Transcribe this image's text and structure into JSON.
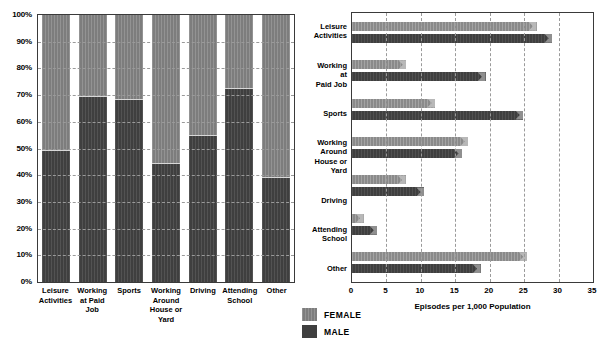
{
  "legend": {
    "items": [
      {
        "key": "female",
        "label": "FEMALE",
        "color": "#7d7d7d"
      },
      {
        "key": "male",
        "label": "MALE",
        "color": "#3f3f3f"
      }
    ]
  },
  "chart_data": [
    {
      "type": "bar",
      "id": "stacked-percent-share",
      "title": "",
      "stacked": true,
      "orientation": "vertical",
      "xlabel": "",
      "ylabel": "",
      "ylim": [
        0,
        100
      ],
      "ytick_labels": [
        "0%",
        "10%",
        "20%",
        "30%",
        "40%",
        "50%",
        "60%",
        "70%",
        "80%",
        "90%",
        "100%"
      ],
      "ytick_values": [
        0,
        10,
        20,
        30,
        40,
        50,
        60,
        70,
        80,
        90,
        100
      ],
      "grid": true,
      "categories": [
        "Leisure Activities",
        "Working at Paid Job",
        "Sports",
        "Working Around House or Yard",
        "Driving",
        "Attending School",
        "Other"
      ],
      "category_lines": [
        [
          "Leisure",
          "Activities"
        ],
        [
          "Working",
          "at Paid",
          "Job"
        ],
        [
          "Sports"
        ],
        [
          "Working",
          "Around",
          "House or",
          "Yard"
        ],
        [
          "Driving"
        ],
        [
          "Attending",
          "School"
        ],
        [
          "Other"
        ]
      ],
      "series": [
        {
          "name": "MALE",
          "color": "#3f3f3f",
          "values": [
            49.5,
            69.5,
            68.5,
            44.5,
            55.0,
            72.5,
            39.5
          ]
        },
        {
          "name": "FEMALE",
          "color": "#7d7d7d",
          "values": [
            50.5,
            30.5,
            31.5,
            55.5,
            45.0,
            27.5,
            60.5
          ]
        }
      ]
    },
    {
      "type": "bar",
      "id": "episodes-per-1000",
      "title": "",
      "orientation": "horizontal",
      "xlabel": "Episodes per 1,000 Population",
      "ylabel": "",
      "xlim": [
        0,
        35
      ],
      "xtick_labels": [
        "0",
        "5",
        "10",
        "15",
        "20",
        "25",
        "30",
        "35"
      ],
      "xtick_values": [
        0,
        5,
        10,
        15,
        20,
        25,
        30,
        35
      ],
      "grid": true,
      "categories": [
        "Leisure Activities",
        "Working at Paid Job",
        "Sports",
        "Working Around House or Yard",
        "Driving",
        "Attending School",
        "Other"
      ],
      "category_lines": [
        [
          "Leisure",
          "Activities"
        ],
        [
          "Working",
          "at",
          "Paid Job"
        ],
        [
          "Sports"
        ],
        [
          "Working",
          "Around",
          "House or",
          "Yard"
        ],
        [
          "Driving"
        ],
        [
          "Attending",
          "School"
        ],
        [
          "Other"
        ]
      ],
      "series": [
        {
          "name": "FEMALE",
          "color": "#8a8a8a",
          "values": [
            26.8,
            7.9,
            12.1,
            16.9,
            7.8,
            1.7,
            25.4
          ]
        },
        {
          "name": "MALE",
          "color": "#3f3f3f",
          "values": [
            29.1,
            19.4,
            24.9,
            16.0,
            10.5,
            3.7,
            18.7
          ]
        }
      ]
    }
  ]
}
